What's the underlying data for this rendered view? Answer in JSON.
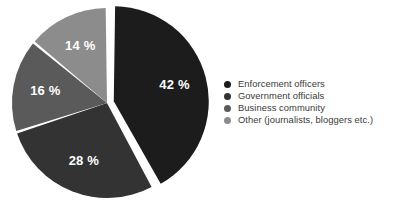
{
  "chart_data": {
    "type": "pie",
    "title": "",
    "subtitle": "",
    "xlabel": "",
    "ylabel": "",
    "grid": false,
    "legend_position": "right",
    "start_angle_deg": 0,
    "direction": "clockwise",
    "exploded_slice_index": 0,
    "background_color": "#ffffff",
    "label_text_color": "#ffffff",
    "legend_text_color": "#3a3a3a",
    "categories": [
      "Enforcement officers",
      "Government officials",
      "Business community",
      "Other (journalists, bloggers etc.)"
    ],
    "values": [
      42,
      28,
      16,
      14
    ],
    "value_labels": [
      "42 %",
      "28 %",
      "16 %",
      "14 %"
    ],
    "colors": [
      "#1c1c1c",
      "#333333",
      "#5a5a5a",
      "#8c8c8c"
    ],
    "slices": [
      {
        "label": "Enforcement officers",
        "value": 42,
        "value_label": "42 %",
        "color": "#1c1c1c",
        "exploded": true
      },
      {
        "label": "Government officials",
        "value": 28,
        "value_label": "28 %",
        "color": "#333333",
        "exploded": false
      },
      {
        "label": "Business community",
        "value": 16,
        "value_label": "16 %",
        "color": "#5a5a5a",
        "exploded": false
      },
      {
        "label": "Other (journalists, bloggers etc.)",
        "value": 14,
        "value_label": "14 %",
        "color": "#8c8c8c",
        "exploded": false
      }
    ]
  },
  "legend": {
    "items": [
      {
        "label": "Enforcement officers",
        "color": "#1c1c1c"
      },
      {
        "label": "Government officials",
        "color": "#333333"
      },
      {
        "label": "Business community",
        "color": "#5a5a5a"
      },
      {
        "label": "Other (journalists, bloggers etc.)",
        "color": "#8c8c8c"
      }
    ]
  },
  "slice_labels": {
    "enforcement_officers": "42 %",
    "government_officials": "28 %",
    "business_community": "16 %",
    "other": "14 %"
  }
}
